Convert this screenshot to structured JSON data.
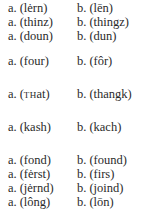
{
  "pairs": [
    {
      "a_label": "a.",
      "a": "(lėrn)",
      "b_label": "b.",
      "b": "(lēn)"
    },
    {
      "a_label": "a.",
      "a": "(thinz)",
      "b_label": "b.",
      "b": "(thingz)"
    },
    {
      "a_label": "a.",
      "a": "(doun)",
      "b_label": "b.",
      "b": "(dun)"
    },
    {
      "a_label": "a.",
      "a": "(four)",
      "b_label": "b.",
      "b": "(fôr)"
    },
    {
      "a_label": "a.",
      "a_pre": "(",
      "a_sc": "TH",
      "a_post": "at)",
      "b_label": "b.",
      "b": "(thangk)"
    },
    {
      "a_label": "a.",
      "a": "(kash)",
      "b_label": "b.",
      "b": "(kach)"
    },
    {
      "a_label": "a.",
      "a": "(fond)",
      "b_label": "b.",
      "b": "(found)"
    },
    {
      "a_label": "a.",
      "a": "(fėrst)",
      "b_label": "b.",
      "b": "(firs)"
    },
    {
      "a_label": "a.",
      "a": "(jėrnd)",
      "b_label": "b.",
      "b": "(joind)"
    },
    {
      "a_label": "a.",
      "a": "(lông)",
      "b_label": "b.",
      "b": "(lōn)"
    }
  ]
}
